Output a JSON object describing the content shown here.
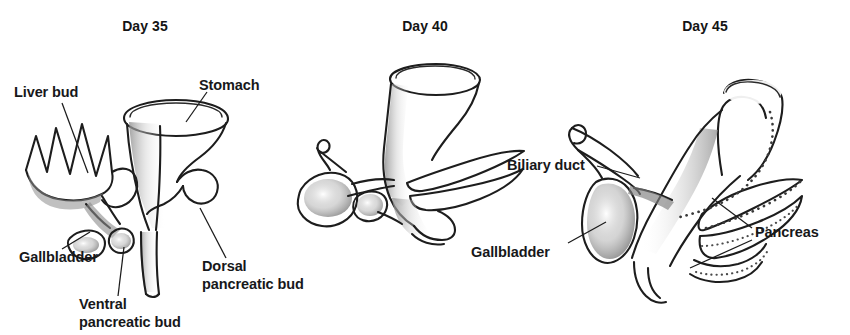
{
  "figure": {
    "kind": "anatomical-development-diagram",
    "background_color": "#ffffff",
    "ink_color": "#1d1d1d",
    "text_color": "#17181a"
  },
  "panels": [
    {
      "id": "day35",
      "title": "Day 35",
      "labels": [
        {
          "id": "liver-bud",
          "text": "Liver bud",
          "line2": ""
        },
        {
          "id": "stomach",
          "text": "Stomach",
          "line2": ""
        },
        {
          "id": "gallbladder",
          "text": "Gallbladder",
          "line2": ""
        },
        {
          "id": "ventral-pancreatic-bud",
          "text": "Ventral",
          "line2": "pancreatic bud"
        },
        {
          "id": "dorsal-pancreatic-bud",
          "text": "Dorsal",
          "line2": "pancreatic bud"
        }
      ]
    },
    {
      "id": "day40",
      "title": "Day 40",
      "labels": []
    },
    {
      "id": "day45",
      "title": "Day 45",
      "labels": [
        {
          "id": "biliary-duct",
          "text": "Biliary duct",
          "line2": ""
        },
        {
          "id": "gallbladder",
          "text": "Gallbladder",
          "line2": ""
        },
        {
          "id": "pancreas",
          "text": "Pancreas",
          "line2": ""
        }
      ]
    }
  ]
}
